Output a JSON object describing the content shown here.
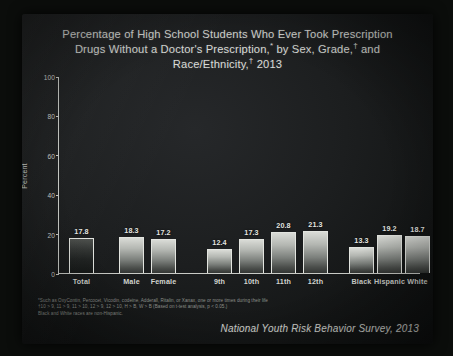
{
  "slide": {
    "title_line1": "Percentage of High School Students Who Ever Took Prescription",
    "title_line2_a": "Drugs Without a Doctor's  Prescription,",
    "title_line2_b": " by Sex, Grade,",
    "title_line2_c": " and",
    "title_line3_a": "Race/Ethnicity,",
    "title_line3_b": " 2013",
    "footnote_marker_1": "*",
    "footnote_marker_2": "†",
    "footnote_marker_3": "†",
    "source": "National Youth Risk Behavior Survey, 2013",
    "footnotes": [
      "*Such as OxyContin, Percocet, Vicodin, codeine, Adderall, Ritalin, or Xanax, one or more times during their life",
      "†10 > 9, 11 > 9, 11 > 10, 12 > 9, 12 > 10, H > B, W > B (Based on t-test analysis, p < 0.05.)",
      "Black and White races are non-Hispanic."
    ]
  },
  "chart_data": {
    "type": "bar",
    "xlabel": "",
    "ylabel": "Percent",
    "ylim": [
      0,
      100
    ],
    "yticks": [
      0,
      20,
      40,
      60,
      80,
      100
    ],
    "ytick_labels": [
      "0",
      "20",
      "40",
      "60",
      "80",
      "100"
    ],
    "grid": false,
    "legend": "none",
    "categories": [
      "Total",
      "Male",
      "Female",
      "9th",
      "10th",
      "11th",
      "12th",
      "Black",
      "Hispanic",
      "White"
    ],
    "values": [
      17.8,
      18.3,
      17.2,
      12.4,
      17.3,
      20.8,
      21.3,
      13.3,
      19.2,
      18.7
    ],
    "value_labels": [
      "17.8",
      "18.3",
      "17.2",
      "12.4",
      "17.3",
      "20.8",
      "21.3",
      "13.3",
      "19.2",
      "18.7"
    ],
    "groups": [
      {
        "name": "Total",
        "indices": [
          0
        ]
      },
      {
        "name": "Sex",
        "indices": [
          1,
          2
        ]
      },
      {
        "name": "Grade",
        "indices": [
          3,
          4,
          5,
          6
        ]
      },
      {
        "name": "Race/Ethnicity",
        "indices": [
          7,
          8,
          9
        ]
      }
    ],
    "colors": {
      "bar_fill_light": "#c2c5c0",
      "bar_fill_dark": "#333634",
      "bar_outline": "#e2e4df",
      "axis": "#c9cbc6",
      "text": "#d8dad6",
      "background": "#1c1e1f"
    }
  }
}
